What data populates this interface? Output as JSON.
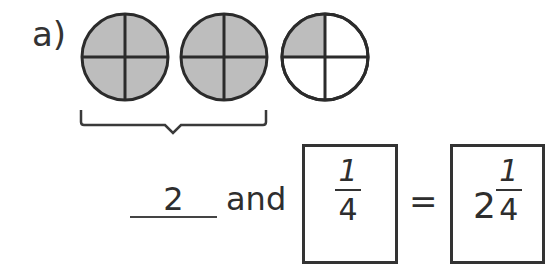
{
  "problem": {
    "label": "a)",
    "circles": [
      {
        "parts": 4,
        "shaded": [
          true,
          true,
          true,
          true
        ]
      },
      {
        "parts": 4,
        "shaded": [
          true,
          true,
          true,
          true
        ]
      },
      {
        "parts": 4,
        "shaded": [
          true,
          false,
          false,
          false
        ]
      }
    ],
    "brace_under": "first two circles",
    "colors": {
      "shade": "#bdbdbd",
      "stroke": "#2b2b2b"
    },
    "equation": {
      "whole_answer": "2",
      "connector": "and",
      "fraction": {
        "numerator": "1",
        "denominator": "4"
      },
      "equals": "=",
      "mixed_number": {
        "whole": "2",
        "numerator": "1",
        "denominator": "4"
      }
    }
  }
}
